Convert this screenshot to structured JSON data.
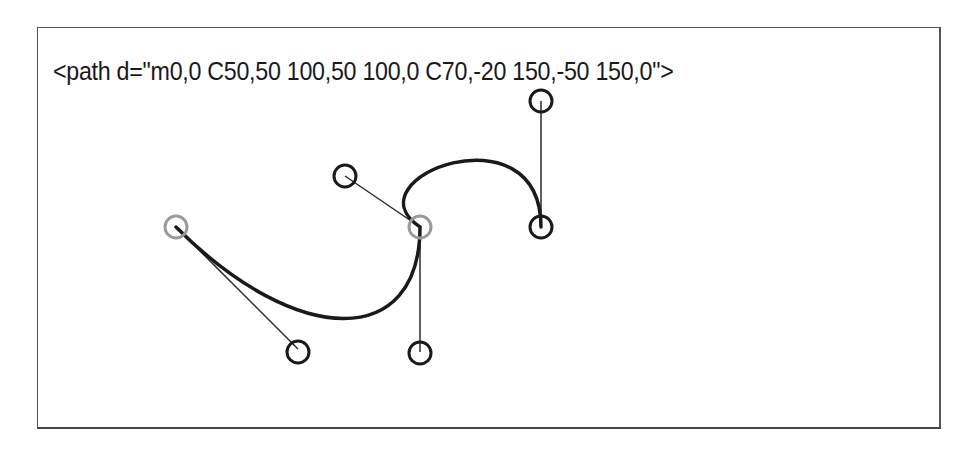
{
  "caption": "<path d=\"m0,0 C50,50 100,50 100,0 C70,-20 150,-50 150,0\">",
  "diagram": {
    "scale_px_per_unit": 2.44,
    "origin_px": [
      176,
      227
    ],
    "segments": [
      {
        "command": "m",
        "start": [
          0,
          0
        ]
      },
      {
        "command": "C",
        "control1": [
          50,
          50
        ],
        "control2": [
          100,
          50
        ],
        "end": [
          100,
          0
        ]
      },
      {
        "command": "C",
        "control1": [
          70,
          -20
        ],
        "control2": [
          150,
          -50
        ],
        "end": [
          150,
          0
        ]
      }
    ],
    "colors": {
      "curve": "#1a1a1a",
      "handle_line": "#2a2a2a",
      "control_point": "#1a1a1a",
      "anchor_point": "#9a9a9a"
    }
  }
}
